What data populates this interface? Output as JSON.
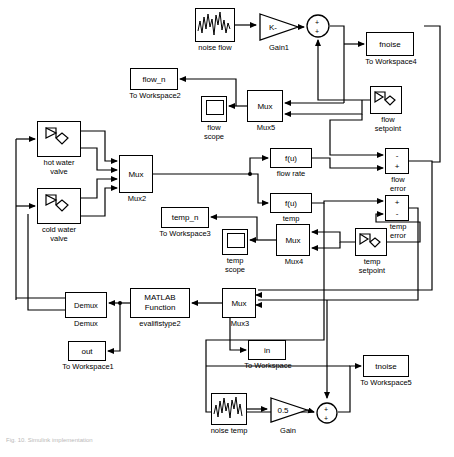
{
  "diagram": {
    "type": "simulink-block-diagram",
    "caption": "Fig. 10. Simulink implementation"
  },
  "blocks": {
    "noise_flow": {
      "label": "noise flow",
      "kind": "band-limited-white-noise",
      "x": 195,
      "y": 8,
      "w": 40,
      "h": 34
    },
    "gain1": {
      "label": "Gain1",
      "value": "K-",
      "kind": "gain-triangle",
      "x": 258,
      "y": 12,
      "w": 40,
      "h": 30
    },
    "sum_flow_noise": {
      "label": "",
      "signs": [
        "+",
        "+"
      ],
      "kind": "sum-round",
      "x": 306,
      "y": 14,
      "w": 24,
      "h": 24
    },
    "fnoise": {
      "label": "fnoise",
      "sub": "To Workspace4",
      "kind": "to-workspace",
      "x": 366,
      "y": 32,
      "w": 48,
      "h": 24
    },
    "flow_n": {
      "label": "flow_n",
      "sub": "To Workspace2",
      "kind": "to-workspace",
      "x": 130,
      "y": 68,
      "w": 48,
      "h": 22
    },
    "flow_scope": {
      "label": "flow\nscope",
      "kind": "scope",
      "x": 201,
      "y": 96,
      "w": 26,
      "h": 26
    },
    "mux5": {
      "label": "Mux",
      "sub": "Mux5",
      "kind": "mux",
      "inputs": 2,
      "x": 247,
      "y": 90,
      "w": 36,
      "h": 32
    },
    "flow_setpoint": {
      "label": "flow\nsetpoint",
      "kind": "signal-generator",
      "x": 370,
      "y": 86,
      "w": 32,
      "h": 28
    },
    "hot_water_valve": {
      "label": "hot water\nvalve",
      "kind": "subsystem",
      "x": 37,
      "y": 121,
      "w": 44,
      "h": 36
    },
    "cold_water_valve": {
      "label": "cold water\nvalve",
      "kind": "subsystem",
      "x": 37,
      "y": 188,
      "w": 44,
      "h": 36
    },
    "mux2": {
      "label": "Mux",
      "sub": "Mux2",
      "kind": "mux",
      "inputs": 4,
      "x": 119,
      "y": 155,
      "w": 34,
      "h": 38
    },
    "flow_rate": {
      "label": "f(u)",
      "sub": "flow rate",
      "kind": "fcn",
      "x": 270,
      "y": 148,
      "w": 42,
      "h": 20
    },
    "temp_fcn": {
      "label": "f(u)",
      "sub": "temp",
      "kind": "fcn",
      "x": 270,
      "y": 193,
      "w": 42,
      "h": 20
    },
    "flow_error": {
      "label": "flow\nerror",
      "signs": [
        "-",
        "+"
      ],
      "kind": "sum-rect",
      "x": 385,
      "y": 148,
      "w": 24,
      "h": 26
    },
    "temp_error": {
      "label": "temp\nerror",
      "signs": [
        "+",
        "-"
      ],
      "kind": "sum-rect",
      "x": 385,
      "y": 195,
      "w": 24,
      "h": 26
    },
    "temp_n": {
      "label": "temp_n",
      "sub": "To Workspace3",
      "kind": "to-workspace",
      "x": 161,
      "y": 207,
      "w": 48,
      "h": 21
    },
    "temp_scope": {
      "label": "temp\nscope",
      "kind": "scope",
      "x": 222,
      "y": 229,
      "w": 26,
      "h": 26
    },
    "mux4": {
      "label": "Mux",
      "sub": "Mux4",
      "kind": "mux",
      "inputs": 2,
      "x": 276,
      "y": 224,
      "w": 34,
      "h": 32
    },
    "temp_setpoint": {
      "label": "temp\nsetpoint",
      "kind": "signal-generator",
      "x": 355,
      "y": 228,
      "w": 32,
      "h": 28
    },
    "demux": {
      "label": "Demux",
      "sub": "Demux",
      "kind": "demux",
      "outputs": 2,
      "x": 65,
      "y": 292,
      "w": 42,
      "h": 26
    },
    "matlab_function": {
      "label": "MATLAB\nFunction",
      "sub": "evalifistype2",
      "kind": "matlab-fcn",
      "x": 130,
      "y": 288,
      "w": 60,
      "h": 30
    },
    "mux3": {
      "label": "Mux",
      "sub": "Mux3",
      "kind": "mux",
      "inputs": 2,
      "x": 222,
      "y": 288,
      "w": 34,
      "h": 30
    },
    "out_ws": {
      "label": "out",
      "sub": "To Workspace1",
      "kind": "to-workspace",
      "x": 68,
      "y": 341,
      "w": 38,
      "h": 20
    },
    "in_ws": {
      "label": "in",
      "sub": "To Workspace",
      "kind": "to-workspace",
      "x": 248,
      "y": 340,
      "w": 38,
      "h": 20
    },
    "tnoise": {
      "label": "tnoise",
      "sub": "To Workspace5",
      "kind": "to-workspace",
      "x": 363,
      "y": 355,
      "w": 46,
      "h": 22
    },
    "sum_temp_noise": {
      "label": "",
      "signs": [
        "+",
        "+"
      ],
      "kind": "sum-round",
      "x": 316,
      "y": 402,
      "w": 22,
      "h": 22
    },
    "noise_temp": {
      "label": "noise temp",
      "kind": "band-limited-white-noise",
      "x": 211,
      "y": 393,
      "w": 36,
      "h": 32
    },
    "gain": {
      "label": "Gain",
      "value": "0.5",
      "kind": "gain-triangle",
      "x": 269,
      "y": 396,
      "w": 38,
      "h": 28
    }
  }
}
